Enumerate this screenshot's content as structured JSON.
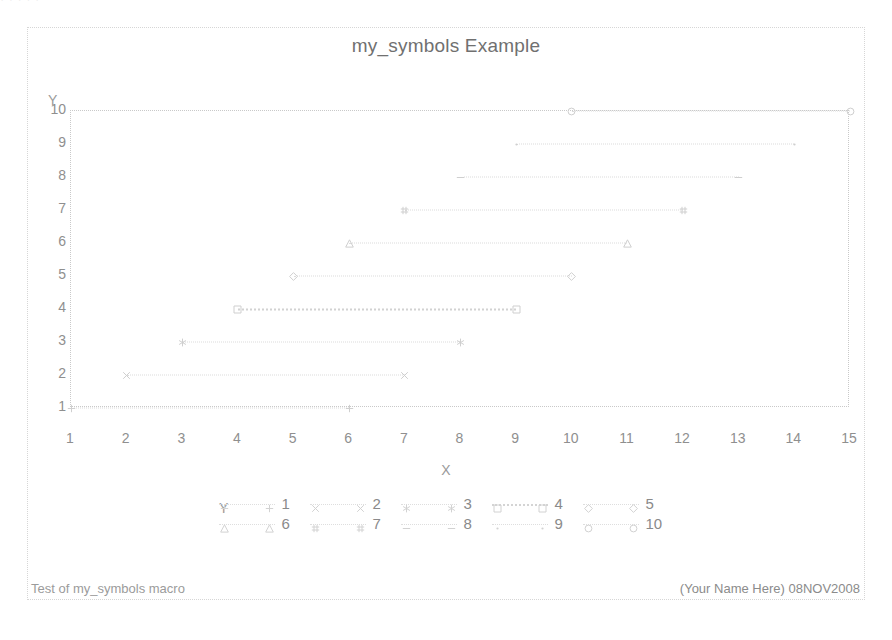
{
  "page": {
    "top_bleed_text": "·                                                                    ·        ·   ·                    ·"
  },
  "title": "my_symbols Example",
  "footnotes": {
    "left": "Test of my_symbols macro",
    "right": "(Your Name Here) 08NOV2008"
  },
  "legend": {
    "title": "Y",
    "entries": [
      {
        "label": "1",
        "marker": "plus",
        "bold": false
      },
      {
        "label": "2",
        "marker": "x",
        "bold": false
      },
      {
        "label": "3",
        "marker": "star",
        "bold": false
      },
      {
        "label": "4",
        "marker": "square",
        "bold": true
      },
      {
        "label": "5",
        "marker": "diamond",
        "bold": false
      },
      {
        "label": "6",
        "marker": "triangle",
        "bold": false
      },
      {
        "label": "7",
        "marker": "hash",
        "bold": false
      },
      {
        "label": "8",
        "marker": "dash",
        "bold": false
      },
      {
        "label": "9",
        "marker": "dot",
        "bold": false
      },
      {
        "label": "10",
        "marker": "circle",
        "bold": false
      }
    ]
  },
  "chart_data": {
    "type": "line",
    "title": "my_symbols Example",
    "xlabel": "X",
    "ylabel": "Y",
    "xlim": [
      1,
      15
    ],
    "ylim": [
      1,
      10
    ],
    "xticks": [
      1,
      2,
      3,
      4,
      5,
      6,
      7,
      8,
      9,
      10,
      11,
      12,
      13,
      14,
      15
    ],
    "yticks": [
      1,
      2,
      3,
      4,
      5,
      6,
      7,
      8,
      9,
      10
    ],
    "grid": false,
    "legend_position": "bottom",
    "line_style": "dotted",
    "series": [
      {
        "name": "1",
        "marker": "plus",
        "y": 1,
        "x": [
          1,
          6
        ],
        "values": [
          1,
          1
        ]
      },
      {
        "name": "2",
        "marker": "x",
        "y": 2,
        "x": [
          2,
          7
        ],
        "values": [
          2,
          2
        ]
      },
      {
        "name": "3",
        "marker": "star",
        "y": 3,
        "x": [
          3,
          8
        ],
        "values": [
          3,
          3
        ]
      },
      {
        "name": "4",
        "marker": "square",
        "y": 4,
        "x": [
          4,
          9
        ],
        "values": [
          4,
          4
        ]
      },
      {
        "name": "5",
        "marker": "diamond",
        "y": 5,
        "x": [
          5,
          10
        ],
        "values": [
          5,
          5
        ]
      },
      {
        "name": "6",
        "marker": "triangle",
        "y": 6,
        "x": [
          6,
          11
        ],
        "values": [
          6,
          6
        ]
      },
      {
        "name": "7",
        "marker": "hash",
        "y": 7,
        "x": [
          7,
          12
        ],
        "values": [
          7,
          7
        ]
      },
      {
        "name": "8",
        "marker": "dash",
        "y": 8,
        "x": [
          8,
          13
        ],
        "values": [
          8,
          8
        ]
      },
      {
        "name": "9",
        "marker": "dot",
        "y": 9,
        "x": [
          9,
          14
        ],
        "values": [
          9,
          9
        ]
      },
      {
        "name": "10",
        "marker": "circle",
        "y": 10,
        "x": [
          10,
          15
        ],
        "values": [
          10,
          10
        ]
      }
    ]
  },
  "colors": {
    "line": "#dcdcdc",
    "marker": "#cfcfcf",
    "text": "#8f8f8f",
    "frame": "#c9c9c9",
    "page_frame": "#d6d6d6",
    "background": "#ffffff"
  }
}
